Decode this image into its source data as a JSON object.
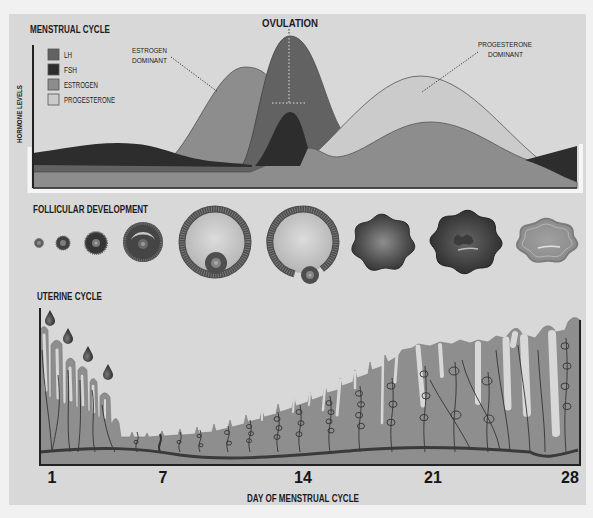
{
  "menstrual_cycle": {
    "title": "MENSTRUAL CYCLE",
    "y_axis_label": "HORMONE LEVELS",
    "legend": [
      {
        "label": "LH",
        "color": "#626262"
      },
      {
        "label": "FSH",
        "color": "#2d2d2d"
      },
      {
        "label": "ESTROGEN",
        "color": "#8d8d8d"
      },
      {
        "label": "PROGESTERONE",
        "color": "#cbcbcb"
      }
    ],
    "annotations": {
      "ovulation": "OVULATION",
      "estrogen_dominant": [
        "ESTROGEN",
        "DOMINANT"
      ],
      "progesterone_dominant": [
        "PROGESTERONE",
        "DOMINANT"
      ]
    }
  },
  "follicular_development": {
    "title": "FOLLICULAR DEVELOPMENT"
  },
  "uterine_cycle": {
    "title": "UTERINE CYCLE",
    "x_ticks": [
      "1",
      "7",
      "14",
      "21",
      "28"
    ],
    "x_axis_label": "DAY OF MENSTRUAL CYCLE"
  },
  "colors": {
    "panel": "#d8d8d8",
    "endometrium": "#8e8e8e",
    "basal_line": "#3a3a3a"
  }
}
